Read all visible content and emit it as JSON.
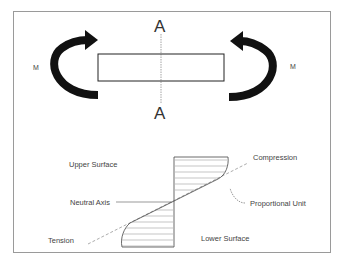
{
  "top_diagram": {
    "section_label_top": "A",
    "section_label_bottom": "A",
    "moment_left": "M",
    "moment_right": "M"
  },
  "stress_diagram": {
    "upper_surface": "Upper Surface",
    "lower_surface": "Lower Surface",
    "neutral_axis": "Neutral Axis",
    "compression": "Compression",
    "tension": "Tension",
    "proportional_unit": "Proportional Unit"
  },
  "colors": {
    "frame": "#9a9a9a",
    "arrow": "#111111",
    "line": "#333333",
    "dashed": "#888888"
  }
}
